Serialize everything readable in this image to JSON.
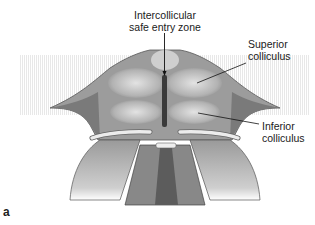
{
  "figure": {
    "panel_letter": "a",
    "labels": {
      "intercollicular": {
        "line1": "Intercollicular",
        "line2": "safe entry zone"
      },
      "superior": {
        "line1": "Superior",
        "line2": "colliculus"
      },
      "inferior": {
        "line1": "Inferior",
        "line2": "colliculus"
      }
    },
    "colors": {
      "background": "#ffffff",
      "tissue_dark": "#6e6e6e",
      "tissue_mid": "#a4a4a4",
      "tissue_light": "#d6d6d6",
      "sulcus": "#3a3a3a",
      "nerve": "#e9e9e9"
    }
  }
}
